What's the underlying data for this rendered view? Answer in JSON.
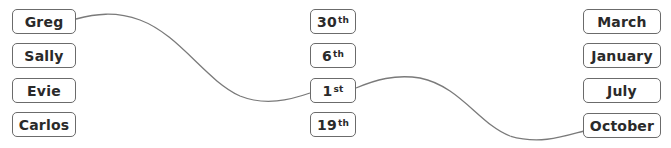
{
  "columns": {
    "names": [
      "Greg",
      "Sally",
      "Evie",
      "Carlos"
    ],
    "dates": [
      {
        "num": "30",
        "suffix": "th"
      },
      {
        "num": "6",
        "suffix": "th"
      },
      {
        "num": "1",
        "suffix": "st"
      },
      {
        "num": "19",
        "suffix": "th"
      }
    ],
    "months": [
      "March",
      "January",
      "July",
      "October"
    ]
  },
  "connections": [
    {
      "from": "Greg",
      "to": "1st"
    },
    {
      "from": "1st",
      "to": "October"
    }
  ],
  "colors": {
    "line": "#7a7a7a",
    "border": "#6b6b6b",
    "text": "#2a2a2a"
  }
}
